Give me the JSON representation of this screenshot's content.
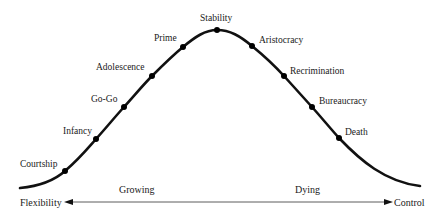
{
  "diagram": {
    "type": "lifecycle-curve",
    "stages": [
      {
        "label": "Courtship",
        "x": 65,
        "y": 171,
        "lx": 20,
        "ly": 167
      },
      {
        "label": "Infancy",
        "x": 96,
        "y": 139,
        "lx": 63,
        "ly": 134
      },
      {
        "label": "Go-Go",
        "x": 124,
        "y": 107,
        "lx": 91,
        "ly": 102
      },
      {
        "label": "Adolescence",
        "x": 152,
        "y": 76,
        "lx": 96,
        "ly": 70
      },
      {
        "label": "Prime",
        "x": 183,
        "y": 47,
        "lx": 154,
        "ly": 41
      },
      {
        "label": "Stability",
        "x": 217,
        "y": 30,
        "lx": 200,
        "ly": 21
      },
      {
        "label": "Aristocracy",
        "x": 252,
        "y": 46,
        "lx": 259,
        "ly": 43
      },
      {
        "label": "Recrimination",
        "x": 284,
        "y": 76,
        "lx": 290,
        "ly": 74
      },
      {
        "label": "Bureaucracy",
        "x": 312,
        "y": 107,
        "lx": 319,
        "ly": 104
      },
      {
        "label": "Death",
        "x": 339,
        "y": 138,
        "lx": 345,
        "ly": 135
      }
    ],
    "axis": {
      "left_label": "Flexibility",
      "right_label": "Control",
      "growing_label": "Growing",
      "dying_label": "Dying"
    },
    "colors": {
      "curve": "#111111",
      "text": "#1a1a1a",
      "background": "#ffffff"
    }
  }
}
